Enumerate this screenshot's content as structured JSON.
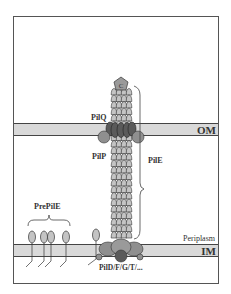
{
  "diagram": {
    "labels": {
      "cap": "C",
      "piliQ": "PilQ",
      "piliP": "PilP",
      "pilE": "PilE",
      "om": "OM",
      "im": "IM",
      "periplasm": "Periplasm",
      "prePilE": "PrePilE",
      "inner_complex": "PilD/F/G/T/..."
    },
    "colors": {
      "membrane_fill": "#d9d9d9",
      "membrane_stroke": "#444444",
      "subunit_fill": "#b8b8b8",
      "pilq_fill": "#5a5a5a",
      "protein_fill": "#8f8f8f",
      "frame": "#555555"
    }
  }
}
